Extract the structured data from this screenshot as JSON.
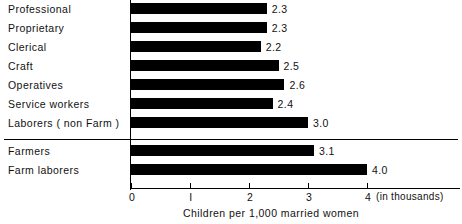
{
  "chart_data": {
    "type": "bar",
    "orientation": "horizontal",
    "title": "",
    "xlabel": "Children per 1,000 married women",
    "ylabel": "",
    "x_unit_note": "(in thousands)",
    "xlim": [
      0,
      4
    ],
    "x_ticks": [
      {
        "value": 0,
        "label": "0"
      },
      {
        "value": 1,
        "label": "I"
      },
      {
        "value": 2,
        "label": "2"
      },
      {
        "value": 3,
        "label": "3"
      },
      {
        "value": 4,
        "label": "4"
      }
    ],
    "grid": false,
    "legend": null,
    "bar_color": "#000000",
    "background_color": "#ffffff",
    "categories": [
      "Professional",
      "Proprietary",
      "Clerical",
      "Craft",
      "Operatives",
      "Service  workers",
      "Laborers ( non Farm )",
      "Farmers",
      "Farm  laborers"
    ],
    "values": [
      2.3,
      2.3,
      2.2,
      2.5,
      2.6,
      2.4,
      3.0,
      3.1,
      4.0
    ],
    "value_labels": [
      "2.3",
      "2.3",
      "2.2",
      "2.5",
      "2.6",
      "2.4",
      "3.0",
      "3.1",
      "4.0"
    ],
    "groups": [
      {
        "name": "nonfarm-occupations",
        "bars": [
          {
            "label": "Professional",
            "value": 2.3,
            "value_label": "2.3"
          },
          {
            "label": "Proprietary",
            "value": 2.3,
            "value_label": "2.3"
          },
          {
            "label": "Clerical",
            "value": 2.2,
            "value_label": "2.2"
          },
          {
            "label": "Craft",
            "value": 2.5,
            "value_label": "2.5"
          },
          {
            "label": "Operatives",
            "value": 2.6,
            "value_label": "2.6"
          },
          {
            "label": "Service  workers",
            "value": 2.4,
            "value_label": "2.4"
          },
          {
            "label": "Laborers ( non Farm )",
            "value": 3.0,
            "value_label": "3.0"
          }
        ]
      },
      {
        "name": "farm-occupations",
        "bars": [
          {
            "label": "Farmers",
            "value": 3.1,
            "value_label": "3.1"
          },
          {
            "label": "Farm  laborers",
            "value": 4.0,
            "value_label": "4.0"
          }
        ]
      }
    ],
    "separator_after_category": "Laborers ( non Farm )"
  }
}
